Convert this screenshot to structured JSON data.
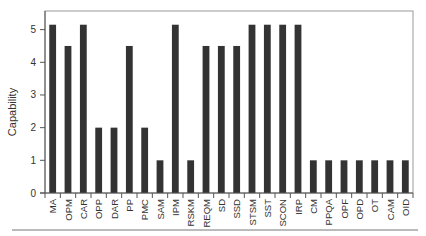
{
  "chart_data": {
    "type": "bar",
    "title": "",
    "xlabel": "",
    "ylabel": "Capability",
    "ylim": [
      0,
      5.57
    ],
    "yticks": [
      0,
      1,
      2,
      3,
      4,
      5
    ],
    "grid": false,
    "legend": null,
    "categories": [
      "MA",
      "OPM",
      "CAR",
      "OPP",
      "DAR",
      "PP",
      "PMC",
      "SAM",
      "IPM",
      "RSKM",
      "REQM",
      "SD",
      "SSD",
      "STSM",
      "SST",
      "SCON",
      "IRP",
      "CM",
      "PPQA",
      "OPF",
      "OPD",
      "OT",
      "CAM",
      "OID"
    ],
    "values": [
      5.15,
      4.5,
      5.15,
      2,
      2,
      4.5,
      2,
      1,
      5.15,
      1,
      4.5,
      4.5,
      4.5,
      5.15,
      5.15,
      5.15,
      5.15,
      1,
      1,
      1,
      1,
      1,
      1,
      1
    ],
    "colors": {
      "bar": "#333333",
      "axis": "#888888",
      "text": "#333333"
    }
  }
}
